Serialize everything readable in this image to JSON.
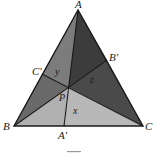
{
  "figure": {
    "vertices": {
      "A": {
        "label": "A",
        "x": 78,
        "y": 10
      },
      "B": {
        "label": "B",
        "x": 14,
        "y": 126
      },
      "C": {
        "label": "C",
        "x": 143,
        "y": 126
      }
    },
    "cevian_feet": {
      "A_prime": {
        "label": "A'",
        "x": 64,
        "y": 126
      },
      "B_prime": {
        "label": "B'",
        "x": 107,
        "y": 60
      },
      "C_prime": {
        "label": "C'",
        "x": 42,
        "y": 74
      }
    },
    "point_P": {
      "label": "P",
      "x": 68,
      "y": 87
    },
    "region_labels": {
      "x": "x",
      "y": "y",
      "z": "z"
    },
    "colors": {
      "region_top_right": "#3a3a3a",
      "region_top_left": "#7a7a7a",
      "region_left": "#6e6e6e",
      "region_bottom": "#b4b4b4",
      "region_right": "#4a4a4a",
      "stroke": "#1a1a1a"
    },
    "caption": ""
  }
}
